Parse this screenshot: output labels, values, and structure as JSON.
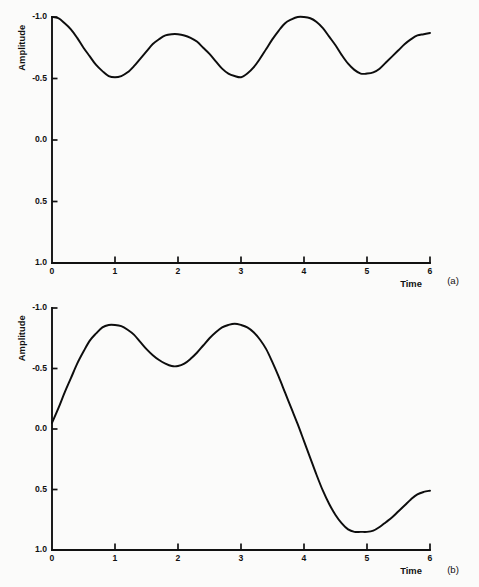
{
  "figure": {
    "background_color": "#fbfbfa",
    "ink_color": "#111111",
    "width": 479,
    "height": 587
  },
  "panels": [
    {
      "tag": "(a)",
      "axis_title_x": "Time",
      "axis_title_y": "Amplitude",
      "ytick_labels": [
        "1.0",
        "0.5",
        "0.0",
        "-0.5",
        "-1.0"
      ],
      "xtick_labels": [
        "0",
        "1",
        "2",
        "3",
        "4",
        "5",
        "6"
      ]
    },
    {
      "tag": "(b)",
      "axis_title_x": "Time",
      "axis_title_y": "Amplitude",
      "ytick_labels": [
        "1.0",
        "0.5",
        "0.0",
        "-0.5",
        "-1.0"
      ],
      "xtick_labels": [
        "0",
        "1",
        "2",
        "3",
        "4",
        "5",
        "6"
      ]
    }
  ],
  "chart_data": [
    {
      "type": "line",
      "title": "",
      "subtitle": "",
      "panel_label": "(a)",
      "xlabel": "Time",
      "ylabel": "Amplitude",
      "xlim": [
        0,
        6
      ],
      "ylim": [
        -1.0,
        1.0
      ],
      "xticks": [
        0,
        1,
        2,
        3,
        4,
        5,
        6
      ],
      "yticks": [
        -1.0,
        -0.5,
        0.0,
        0.5,
        1.0
      ],
      "grid": false,
      "legend": "none",
      "annotations": [],
      "series": [
        {
          "name": "amplitude",
          "x": [
            0.0,
            0.1,
            0.2,
            0.3,
            0.4,
            0.5,
            0.6,
            0.7,
            0.8,
            0.9,
            1.0,
            1.1,
            1.2,
            1.3,
            1.4,
            1.5,
            1.6,
            1.7,
            1.8,
            1.9,
            2.0,
            2.1,
            2.2,
            2.3,
            2.4,
            2.5,
            2.6,
            2.7,
            2.8,
            2.9,
            3.0,
            3.1,
            3.2,
            3.3,
            3.4,
            3.5,
            3.6,
            3.7,
            3.8,
            3.9,
            4.0,
            4.1,
            4.2,
            4.3,
            4.4,
            4.5,
            4.6,
            4.7,
            4.8,
            4.9,
            5.0,
            5.1,
            5.2,
            5.3,
            5.4,
            5.5,
            5.6,
            5.7,
            5.8,
            5.9,
            6.0
          ],
          "y": [
            1.0,
            0.99,
            0.95,
            0.9,
            0.83,
            0.75,
            0.68,
            0.61,
            0.56,
            0.52,
            0.51,
            0.52,
            0.55,
            0.6,
            0.66,
            0.72,
            0.78,
            0.82,
            0.85,
            0.86,
            0.86,
            0.85,
            0.83,
            0.8,
            0.75,
            0.7,
            0.64,
            0.58,
            0.54,
            0.52,
            0.51,
            0.54,
            0.59,
            0.66,
            0.74,
            0.82,
            0.89,
            0.95,
            0.98,
            1.0,
            1.0,
            0.99,
            0.96,
            0.91,
            0.84,
            0.77,
            0.69,
            0.62,
            0.57,
            0.54,
            0.54,
            0.55,
            0.58,
            0.63,
            0.68,
            0.73,
            0.78,
            0.82,
            0.85,
            0.86,
            0.87
          ]
        }
      ]
    },
    {
      "type": "line",
      "title": "",
      "subtitle": "",
      "panel_label": "(b)",
      "xlabel": "Time",
      "ylabel": "Amplitude",
      "xlim": [
        0,
        6
      ],
      "ylim": [
        -1.0,
        1.0
      ],
      "xticks": [
        0,
        1,
        2,
        3,
        4,
        5,
        6
      ],
      "yticks": [
        -1.0,
        -0.5,
        0.0,
        0.5,
        1.0
      ],
      "grid": false,
      "legend": "none",
      "annotations": [],
      "series": [
        {
          "name": "amplitude",
          "x": [
            0.0,
            0.1,
            0.2,
            0.3,
            0.4,
            0.5,
            0.6,
            0.7,
            0.8,
            0.9,
            1.0,
            1.1,
            1.2,
            1.3,
            1.4,
            1.5,
            1.6,
            1.7,
            1.8,
            1.9,
            2.0,
            2.1,
            2.2,
            2.3,
            2.4,
            2.5,
            2.6,
            2.7,
            2.8,
            2.9,
            3.0,
            3.1,
            3.2,
            3.3,
            3.4,
            3.5,
            3.6,
            3.7,
            3.8,
            3.9,
            4.0,
            4.1,
            4.2,
            4.3,
            4.4,
            4.5,
            4.6,
            4.7,
            4.8,
            4.9,
            5.0,
            5.1,
            5.2,
            5.3,
            5.4,
            5.5,
            5.6,
            5.7,
            5.8,
            5.9,
            6.0
          ],
          "y": [
            0.05,
            0.17,
            0.3,
            0.42,
            0.54,
            0.64,
            0.73,
            0.79,
            0.84,
            0.86,
            0.86,
            0.85,
            0.82,
            0.78,
            0.72,
            0.66,
            0.61,
            0.57,
            0.54,
            0.52,
            0.52,
            0.54,
            0.58,
            0.63,
            0.69,
            0.75,
            0.8,
            0.84,
            0.86,
            0.87,
            0.86,
            0.84,
            0.8,
            0.74,
            0.66,
            0.55,
            0.43,
            0.3,
            0.17,
            0.04,
            -0.1,
            -0.24,
            -0.38,
            -0.51,
            -0.62,
            -0.71,
            -0.78,
            -0.83,
            -0.85,
            -0.85,
            -0.85,
            -0.84,
            -0.81,
            -0.77,
            -0.73,
            -0.68,
            -0.63,
            -0.58,
            -0.54,
            -0.52,
            -0.51
          ]
        }
      ]
    }
  ]
}
